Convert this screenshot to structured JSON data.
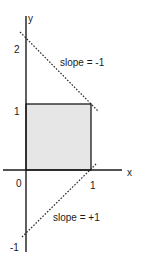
{
  "diagram": {
    "axes": {
      "x_label": "x",
      "y_label": "y",
      "origin_label": "0",
      "x_ticks": [
        "1"
      ],
      "y_ticks": [
        "2",
        "1",
        "-1"
      ]
    },
    "region": {
      "description": "unit square shaded",
      "x_range": [
        0,
        1
      ],
      "y_range": [
        0,
        1
      ],
      "fill_color": "#e6e6e6"
    },
    "lines": [
      {
        "label": "slope = -1",
        "slope": -1,
        "intercept": 2,
        "style": "dotted"
      },
      {
        "label": "slope = +1",
        "slope": 1,
        "intercept": -1,
        "style": "dotted"
      }
    ]
  }
}
